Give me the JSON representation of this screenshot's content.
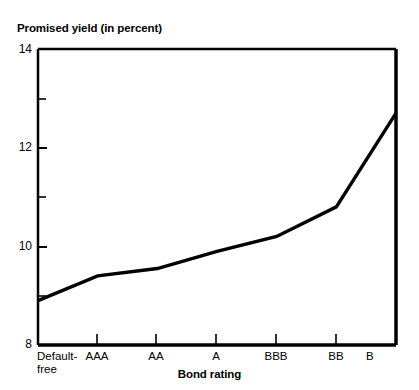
{
  "chart_data": {
    "type": "line",
    "title": "Promised yield (in percent)",
    "xlabel": "Bond rating",
    "ylabel": "Promised yield (in percent)",
    "categories": [
      "Default-free",
      "AAA",
      "AA",
      "A",
      "BBB",
      "BB",
      "B"
    ],
    "values": [
      8.9,
      9.4,
      9.55,
      9.9,
      10.2,
      10.8,
      12.7
    ],
    "series": [
      {
        "name": "Promised yield",
        "values": [
          8.9,
          9.4,
          9.55,
          9.9,
          10.2,
          10.8,
          12.7
        ]
      }
    ],
    "ylim": [
      8,
      14
    ],
    "xlim": [
      0,
      6
    ],
    "y_major_ticks": [
      8,
      10,
      12,
      14
    ],
    "y_minor_ticks": [
      9,
      11,
      13
    ],
    "y_tick_labels": [
      "8",
      "10",
      "12",
      "14"
    ],
    "grid": false,
    "legend": false,
    "legend_position": "none",
    "line_color": "#000000",
    "background_color": "#ffffff",
    "axis_color": "#000000"
  },
  "labels": {
    "y_axis_title": "Promised yield (in percent)",
    "x_axis_title": "Bond rating",
    "y_ticks": [
      "14",
      "12",
      "10",
      "8"
    ],
    "x_ticks": [
      {
        "line1": "Default-",
        "line2": "free"
      },
      {
        "line1": "AAA",
        "line2": ""
      },
      {
        "line1": "AA",
        "line2": ""
      },
      {
        "line1": "A",
        "line2": ""
      },
      {
        "line1": "BBB",
        "line2": ""
      },
      {
        "line1": "BB",
        "line2": ""
      },
      {
        "line1": "B",
        "line2": ""
      }
    ]
  }
}
